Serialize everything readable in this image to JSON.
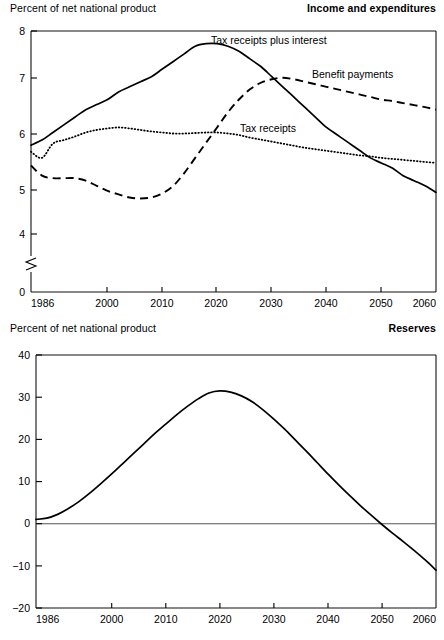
{
  "figure": {
    "axis_caption": "Percent of net national product"
  },
  "panels": [
    {
      "id": "income-and-expenditures",
      "title": "Income and expenditures",
      "caption": "Percent of net national product",
      "y_ticks": [
        "8",
        "7",
        "6",
        "5",
        "4",
        "0"
      ],
      "x_ticks": [
        "1986",
        "2000",
        "2010",
        "2020",
        "2030",
        "2040",
        "2050",
        "2060"
      ],
      "series_labels": {
        "tax_receipts_plus_interest": "Tax receipts plus interest",
        "benefit_payments": "Benefit payments",
        "tax_receipts": "Tax receipts"
      }
    },
    {
      "id": "reserves",
      "title": "Reserves",
      "caption": "Percent of net national product",
      "y_ticks": [
        "40",
        "30",
        "20",
        "10",
        "0",
        "−10",
        "−20"
      ],
      "x_ticks": [
        "1986",
        "2000",
        "2010",
        "2020",
        "2030",
        "2040",
        "2050",
        "2060"
      ],
      "series_labels": {
        "cumulative_surplus_or_deficit": "Cumulative surplus or deficit"
      }
    }
  ],
  "chart_data": [
    {
      "type": "line",
      "id": "income-and-expenditures",
      "title": "Income and expenditures",
      "xlabel": "",
      "ylabel": "Percent of net national product",
      "xlim": [
        1986,
        2060
      ],
      "ylim": [
        4,
        8
      ],
      "y_axis_break": "axis broken between 0 and 4",
      "grid": false,
      "legend": "inline labels on curves",
      "xticks": [
        1986,
        2000,
        2010,
        2020,
        2030,
        2040,
        2050,
        2060
      ],
      "yticks": [
        0,
        4,
        5,
        6,
        7,
        8
      ],
      "series": [
        {
          "name": "Tax receipts plus interest",
          "style": "solid",
          "x": [
            1986,
            1988,
            1990,
            1992,
            1994,
            1996,
            1998,
            2000,
            2002,
            2004,
            2006,
            2008,
            2010,
            2012,
            2014,
            2016,
            2018,
            2020,
            2022,
            2024,
            2026,
            2028,
            2030,
            2032,
            2034,
            2036,
            2038,
            2040,
            2042,
            2044,
            2046,
            2048,
            2050,
            2052,
            2054,
            2056,
            2058,
            2060
          ],
          "values": [
            5.75,
            5.85,
            6.0,
            6.15,
            6.3,
            6.45,
            6.55,
            6.65,
            6.8,
            6.9,
            7.0,
            7.1,
            7.25,
            7.4,
            7.55,
            7.7,
            7.75,
            7.75,
            7.7,
            7.6,
            7.45,
            7.3,
            7.1,
            6.9,
            6.7,
            6.5,
            6.3,
            6.1,
            5.95,
            5.8,
            5.65,
            5.5,
            5.4,
            5.3,
            5.15,
            5.05,
            4.95,
            4.82
          ]
        },
        {
          "name": "Benefit payments",
          "style": "dashed",
          "x": [
            1986,
            1988,
            1990,
            1992,
            1994,
            1996,
            1998,
            2000,
            2002,
            2004,
            2006,
            2008,
            2010,
            2012,
            2014,
            2016,
            2018,
            2020,
            2022,
            2024,
            2026,
            2028,
            2030,
            2032,
            2034,
            2036,
            2038,
            2040,
            2042,
            2044,
            2046,
            2048,
            2050,
            2052,
            2054,
            2056,
            2058,
            2060
          ],
          "values": [
            5.35,
            5.15,
            5.1,
            5.1,
            5.1,
            5.05,
            4.95,
            4.85,
            4.78,
            4.72,
            4.7,
            4.72,
            4.8,
            4.95,
            5.2,
            5.5,
            5.8,
            6.1,
            6.4,
            6.65,
            6.85,
            6.98,
            7.05,
            7.08,
            7.05,
            7.0,
            6.95,
            6.9,
            6.85,
            6.8,
            6.75,
            6.7,
            6.65,
            6.62,
            6.58,
            6.54,
            6.5,
            6.45
          ]
        },
        {
          "name": "Tax receipts",
          "style": "dotted",
          "x": [
            1986,
            1988,
            1990,
            1992,
            1994,
            1996,
            1998,
            2000,
            2002,
            2004,
            2006,
            2008,
            2010,
            2012,
            2014,
            2016,
            2018,
            2020,
            2022,
            2024,
            2026,
            2028,
            2030,
            2032,
            2034,
            2036,
            2038,
            2040,
            2042,
            2044,
            2046,
            2048,
            2050,
            2052,
            2054,
            2056,
            2058,
            2060
          ],
          "values": [
            5.62,
            5.5,
            5.78,
            5.85,
            5.92,
            6.0,
            6.05,
            6.08,
            6.1,
            6.08,
            6.05,
            6.02,
            6.0,
            5.98,
            5.98,
            5.99,
            6.0,
            6.0,
            5.98,
            5.95,
            5.9,
            5.86,
            5.82,
            5.78,
            5.74,
            5.7,
            5.67,
            5.64,
            5.61,
            5.58,
            5.55,
            5.53,
            5.5,
            5.48,
            5.46,
            5.44,
            5.42,
            5.4
          ]
        }
      ]
    },
    {
      "type": "line",
      "id": "reserves",
      "title": "Reserves",
      "xlabel": "",
      "ylabel": "Percent of net national product",
      "xlim": [
        1986,
        2060
      ],
      "ylim": [
        -20,
        40
      ],
      "grid": false,
      "legend": "inline label on curve",
      "xticks": [
        1986,
        2000,
        2010,
        2020,
        2030,
        2040,
        2050,
        2060
      ],
      "yticks": [
        -20,
        -10,
        0,
        10,
        20,
        30,
        40
      ],
      "series": [
        {
          "name": "Cumulative surplus or deficit",
          "style": "solid",
          "x": [
            1986,
            1988,
            1990,
            1992,
            1994,
            1996,
            1998,
            2000,
            2002,
            2004,
            2006,
            2008,
            2010,
            2012,
            2014,
            2016,
            2018,
            2020,
            2022,
            2024,
            2026,
            2028,
            2030,
            2032,
            2034,
            2036,
            2038,
            2040,
            2042,
            2044,
            2046,
            2048,
            2050,
            2052,
            2054,
            2056,
            2058,
            2060
          ],
          "values": [
            1.0,
            1.3,
            2.2,
            3.6,
            5.3,
            7.3,
            9.5,
            11.8,
            14.2,
            16.6,
            19.0,
            21.4,
            23.6,
            25.8,
            27.8,
            29.6,
            31.0,
            31.5,
            31.2,
            30.3,
            28.9,
            27.0,
            24.8,
            22.4,
            19.8,
            17.2,
            14.5,
            11.8,
            9.2,
            6.7,
            4.3,
            2.0,
            -0.2,
            -2.3,
            -4.3,
            -6.4,
            -8.6,
            -11.0
          ]
        }
      ]
    }
  ]
}
